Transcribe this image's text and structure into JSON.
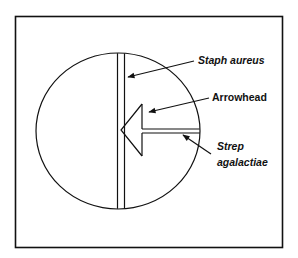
{
  "diagram": {
    "type": "CAMP test plate schematic",
    "labels": {
      "staph": "Staph aureus",
      "arrowhead": "Arrowhead",
      "strep_line1": "Strep",
      "strep_line2": "agalactiae"
    },
    "colors": {
      "stroke": "#111111",
      "background": "#ffffff"
    }
  }
}
